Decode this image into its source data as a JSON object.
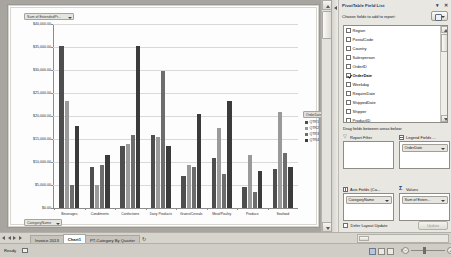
{
  "chart": {
    "value_field_button": "Sum of ExtendedPr...",
    "category_field_button": "CategoryName",
    "legend_button": "OrderDate"
  },
  "chart_data": {
    "type": "bar",
    "title": "",
    "xlabel": "CategoryName",
    "ylabel": "Sum of ExtendedPrice",
    "categories": [
      "Beverages",
      "Condiments",
      "Confections",
      "Dairy Products",
      "Grains/Cereals",
      "Meat/Poultry",
      "Produce",
      "Seafood"
    ],
    "series": [
      {
        "name": "QTR1",
        "values": [
          35500,
          9000,
          13500,
          16000,
          7000,
          11000,
          4500,
          8500
        ]
      },
      {
        "name": "QTR2",
        "values": [
          23500,
          5000,
          14000,
          15500,
          9500,
          17500,
          11500,
          21000
        ]
      },
      {
        "name": "QTR3",
        "values": [
          5000,
          9500,
          16000,
          30000,
          9000,
          7500,
          3500,
          12000
        ]
      },
      {
        "name": "QTR4",
        "values": [
          18000,
          11500,
          35500,
          13500,
          20500,
          23500,
          8000,
          9000
        ]
      }
    ],
    "ytick_labels": [
      "$40,000.00",
      "$35,000.00",
      "$30,000.00",
      "$25,000.00",
      "$20,000.00",
      "$15,000.00",
      "$10,000.00",
      "$5,000.00",
      "$0.00"
    ],
    "ylim": [
      0,
      40000
    ],
    "ystep": 5000,
    "grid": true,
    "legend_position": "right",
    "legend_title": "OrderDate",
    "colors": {
      "QTR1": "#4e4e4e",
      "QTR2": "#9a9a9a",
      "QTR3": "#6d6d6d",
      "QTR4": "#3b3b3b"
    }
  },
  "pane": {
    "title": "PivotTable Field List",
    "menu_icon": "chevron-down-icon",
    "close_icon": "close-icon",
    "choose_label": "Choose fields to add to report:",
    "fields": [
      {
        "label": "Region",
        "checked": false
      },
      {
        "label": "PostalCode",
        "checked": false
      },
      {
        "label": "Country",
        "checked": false
      },
      {
        "label": "Salesperson",
        "checked": false
      },
      {
        "label": "OrderID",
        "checked": false
      },
      {
        "label": "OrderDate",
        "checked": true
      },
      {
        "label": "Weekday",
        "checked": false
      },
      {
        "label": "RequireDate",
        "checked": false
      },
      {
        "label": "ShippedDate",
        "checked": false
      },
      {
        "label": "Shipper",
        "checked": false
      },
      {
        "label": "ProductID",
        "checked": false
      },
      {
        "label": "ProductName",
        "checked": false
      }
    ],
    "drag_label": "Drag fields between areas below:",
    "areas": {
      "report_filter": {
        "header": "Report Filter",
        "items": []
      },
      "legend_fields": {
        "header": "Legend Fields ...",
        "items": [
          "OrderDate"
        ]
      },
      "axis_fields": {
        "header": "Axis Fields (Ca...",
        "items": [
          "CategoryName"
        ]
      },
      "values": {
        "header": "Values",
        "items": [
          "Sum of Exten..."
        ]
      }
    },
    "defer_label": "Defer Layout Update",
    "defer_checked": false,
    "update_button": "Update"
  },
  "tabs": {
    "items": [
      {
        "label": "Invoice 2013",
        "active": false
      },
      {
        "label": "Chart1",
        "active": true
      },
      {
        "label": "PT-Category By Quarter",
        "active": false
      }
    ],
    "add_sheet_icon": "add-sheet-icon"
  },
  "status": {
    "ready": "Ready",
    "zoom": "70%",
    "zoom_out_icon": "minus-icon",
    "zoom_in_icon": "plus-icon"
  }
}
